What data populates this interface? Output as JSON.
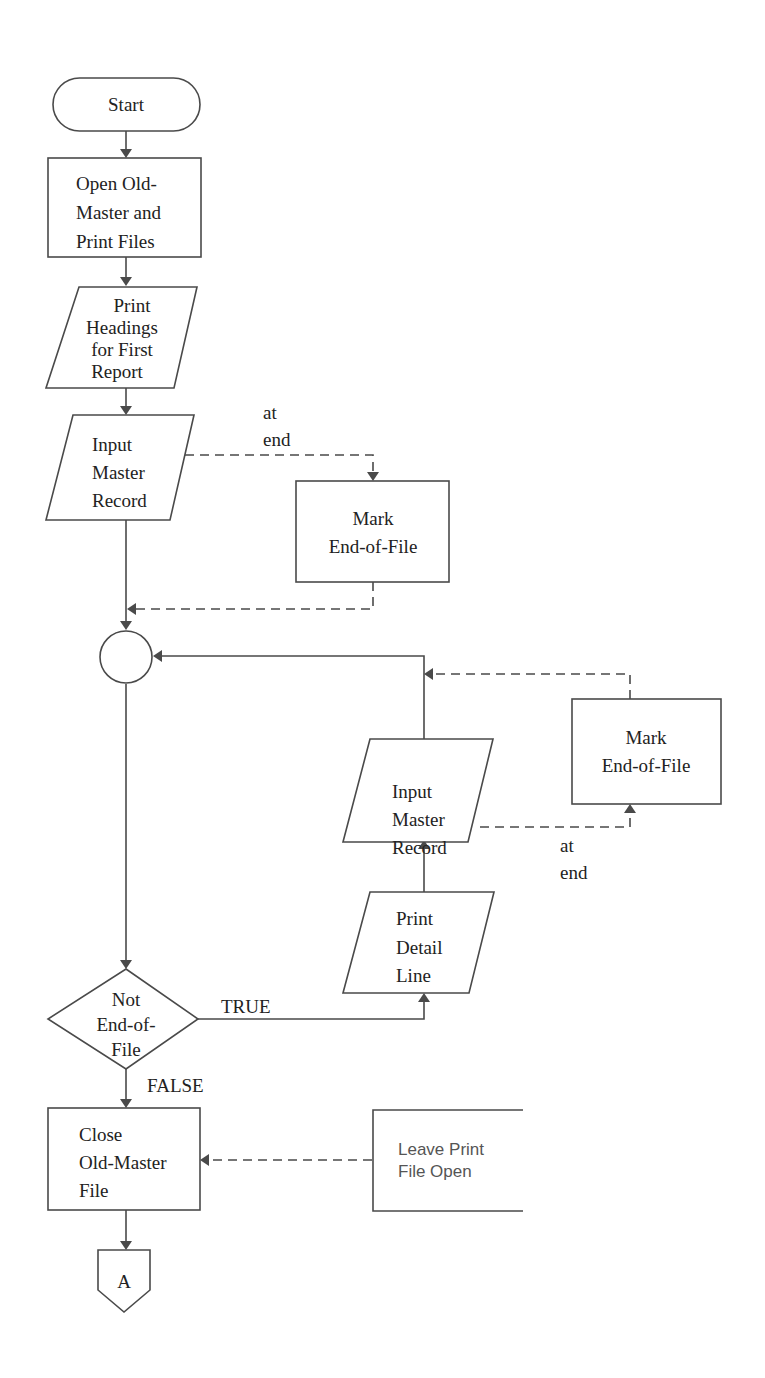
{
  "diagram": {
    "type": "flowchart",
    "nodes": {
      "start": {
        "kind": "terminal",
        "lines": [
          "Start"
        ]
      },
      "open_files": {
        "kind": "process",
        "lines": [
          "Open Old-",
          "Master and",
          "Print Files"
        ]
      },
      "print_headings": {
        "kind": "io",
        "lines": [
          "Print",
          "Headings",
          "for First",
          "Report"
        ]
      },
      "input_master_1": {
        "kind": "io",
        "lines": [
          "Input",
          "Master",
          "Record"
        ]
      },
      "mark_eof_1": {
        "kind": "process",
        "lines": [
          "Mark",
          "End-of-File"
        ]
      },
      "connector": {
        "kind": "connector",
        "lines": []
      },
      "input_master_2": {
        "kind": "io",
        "lines": [
          "Input",
          "Master",
          "Record"
        ]
      },
      "mark_eof_2": {
        "kind": "process",
        "lines": [
          "Mark",
          "End-of-File"
        ]
      },
      "print_detail": {
        "kind": "io",
        "lines": [
          "Print",
          "Detail",
          "Line"
        ]
      },
      "decision": {
        "kind": "decision",
        "lines": [
          "Not",
          "End-of-",
          "File"
        ]
      },
      "close_master": {
        "kind": "process",
        "lines": [
          "Close",
          "Old-Master",
          "File"
        ]
      },
      "annotation": {
        "kind": "annotation",
        "lines": [
          "Leave Print",
          "File Open"
        ]
      },
      "offpage_a": {
        "kind": "offpage-connector",
        "lines": [
          "A"
        ]
      }
    },
    "edge_labels": {
      "at_end_1": [
        "at",
        "end"
      ],
      "at_end_2": [
        "at",
        "end"
      ],
      "true": "TRUE",
      "false": "FALSE"
    },
    "edges": [
      {
        "from": "start",
        "to": "open_files",
        "style": "solid"
      },
      {
        "from": "open_files",
        "to": "print_headings",
        "style": "solid"
      },
      {
        "from": "print_headings",
        "to": "input_master_1",
        "style": "solid"
      },
      {
        "from": "input_master_1",
        "to": "mark_eof_1",
        "style": "dashed",
        "label": "at end"
      },
      {
        "from": "input_master_1",
        "to": "connector",
        "style": "solid"
      },
      {
        "from": "mark_eof_1",
        "to": "connector",
        "style": "dashed"
      },
      {
        "from": "connector",
        "to": "decision",
        "style": "solid"
      },
      {
        "from": "decision",
        "to": "print_detail",
        "style": "solid",
        "label": "TRUE"
      },
      {
        "from": "print_detail",
        "to": "input_master_2",
        "style": "solid"
      },
      {
        "from": "input_master_2",
        "to": "mark_eof_2",
        "style": "dashed",
        "label": "at end"
      },
      {
        "from": "input_master_2",
        "to": "connector",
        "style": "solid"
      },
      {
        "from": "mark_eof_2",
        "to": "connector",
        "style": "dashed"
      },
      {
        "from": "decision",
        "to": "close_master",
        "style": "solid",
        "label": "FALSE"
      },
      {
        "from": "annotation",
        "to": "close_master",
        "style": "dashed"
      },
      {
        "from": "close_master",
        "to": "offpage_a",
        "style": "solid"
      }
    ]
  }
}
